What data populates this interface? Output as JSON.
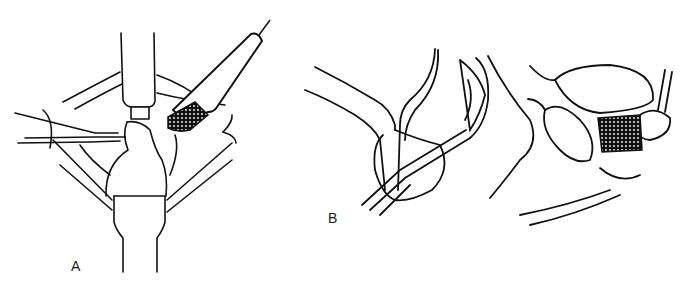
{
  "figure": {
    "panels": [
      {
        "id": "A",
        "label": "A",
        "description": "surgical view with clamp, catheter/drain and mesh-covered tissue"
      },
      {
        "id": "B",
        "label": "B",
        "description": "sagittal anatomical views with mesh placement"
      }
    ]
  },
  "colors": {
    "ink": "#111111",
    "background": "#ffffff"
  }
}
